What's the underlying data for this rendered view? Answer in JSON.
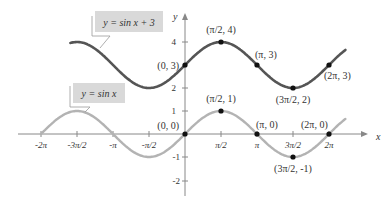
{
  "chart_data": {
    "type": "line",
    "title": "",
    "xlabel": "x",
    "ylabel": "y",
    "xlim": [
      -6.283,
      6.9
    ],
    "ylim": [
      -2.3,
      4.8
    ],
    "grid": false,
    "x_ticks": [
      "-2π",
      "-3π/2",
      "-π",
      "-π/2",
      "π/2",
      "π",
      "3π/2",
      "2π"
    ],
    "x_tick_values": [
      -6.2832,
      -4.7124,
      -3.1416,
      -1.5708,
      1.5708,
      3.1416,
      4.7124,
      6.2832
    ],
    "y_ticks": [
      "-2",
      "-1",
      "1",
      "2",
      "4"
    ],
    "y_tick_values": [
      -2,
      -1,
      1,
      2,
      4
    ],
    "series": [
      {
        "name": "y = sin x + 3",
        "color": "#555555",
        "x_range": [
          -5.0,
          7.0
        ],
        "points": [
          {
            "x": 0,
            "y": 3,
            "label": "(0, 3)"
          },
          {
            "x": 1.5708,
            "y": 4,
            "label": "(π/2, 4)"
          },
          {
            "x": 3.1416,
            "y": 3,
            "label": "(π, 3)"
          },
          {
            "x": 4.7124,
            "y": 2,
            "label": "(3π/2, 2)"
          },
          {
            "x": 6.2832,
            "y": 3,
            "label": "(2π, 3)"
          }
        ]
      },
      {
        "name": "y = sin x",
        "color": "#b3b3b3",
        "x_range": [
          -6.2832,
          7.0
        ],
        "points": [
          {
            "x": 0,
            "y": 0,
            "label": "(0, 0)"
          },
          {
            "x": 1.5708,
            "y": 1,
            "label": "(π/2, 1)"
          },
          {
            "x": 3.1416,
            "y": 0,
            "label": "(π, 0)"
          },
          {
            "x": 4.7124,
            "y": -1,
            "label": "(3π/2, -1)"
          },
          {
            "x": 6.2832,
            "y": 0,
            "label": "(2π, 0)"
          }
        ]
      }
    ],
    "annotations": [
      {
        "text": "y = sin x + 3",
        "style": "boxed label with leader line"
      },
      {
        "text": "y = sin x",
        "style": "boxed label with leader line"
      }
    ]
  },
  "legend": {
    "upper": "y = sin x + 3",
    "lower": "y = sin x"
  },
  "axes": {
    "x_label": "x",
    "y_label": "y"
  }
}
